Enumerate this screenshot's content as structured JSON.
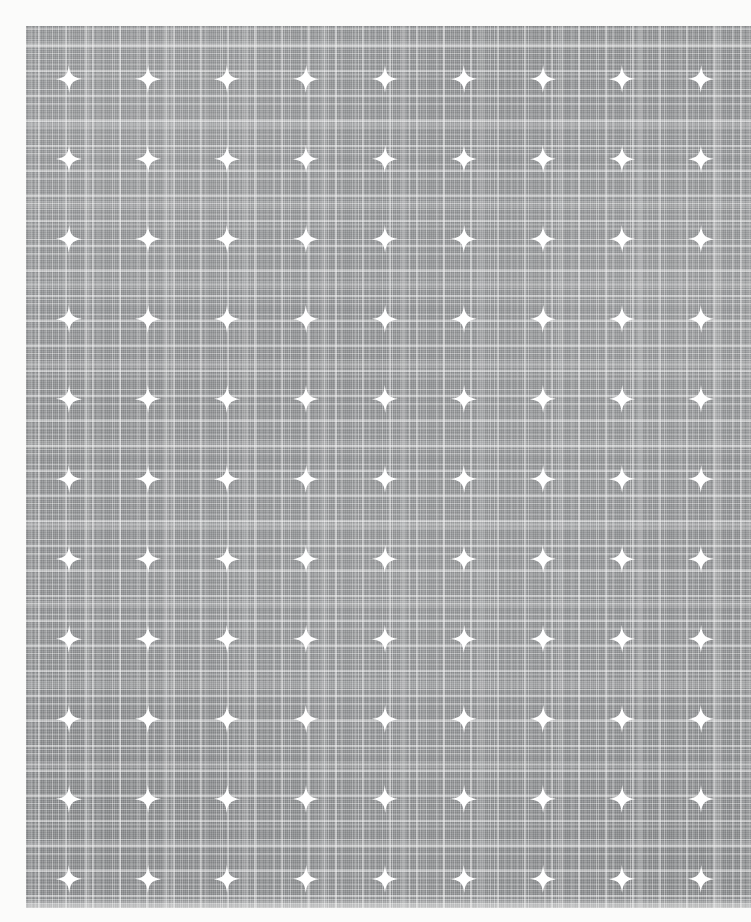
{
  "image": {
    "subject": "printed linen fabric swatch",
    "description": "Flat-lay photograph of a grey woven plaid linen cloth printed with a regular grid of white four-pointed sparkle motifs.",
    "canvas": {
      "width": 751,
      "height": 922
    },
    "background_color": "#fbfbfa"
  },
  "swatch": {
    "name": "fabric-swatch",
    "left": 26,
    "top": 26,
    "width": 725,
    "height": 882,
    "base_color": "#8d8f91",
    "thread_color": "#ffffff",
    "weave": {
      "type": "plaid",
      "warp_band_spacing": 79,
      "weft_band_spacing": 80,
      "fine_thread_spacing": 2
    }
  },
  "motif": {
    "name": "four-pointed-sparkle",
    "color": "#ffffff",
    "width": 26,
    "height": 28,
    "grid": {
      "columns": 9,
      "rows": 11,
      "column_spacing": 79,
      "row_spacing": 80,
      "first_center_x": 69,
      "first_center_y": 79,
      "staggered": false
    }
  },
  "layers": [
    {
      "name": "vertical-coarse-threads",
      "axis": "vertical",
      "weight": "coarse"
    },
    {
      "name": "vertical-mid-threads",
      "axis": "vertical",
      "weight": "medium"
    },
    {
      "name": "vertical-plaid-bands",
      "axis": "vertical",
      "weight": "band"
    },
    {
      "name": "horizontal-coarse-threads",
      "axis": "horizontal",
      "weight": "coarse"
    },
    {
      "name": "horizontal-mid-threads",
      "axis": "horizontal",
      "weight": "medium"
    },
    {
      "name": "horizontal-plaid-bands",
      "axis": "horizontal",
      "weight": "band"
    },
    {
      "name": "fine-weave-tooth",
      "axis": "both",
      "weight": "fine"
    },
    {
      "name": "dye-wash-unevenness",
      "axis": "none",
      "weight": "wash"
    }
  ]
}
